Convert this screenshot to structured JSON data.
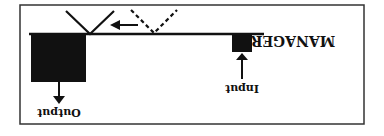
{
  "diagram": {
    "orientation": "rotated 180 degrees",
    "title": "MANAGER",
    "input_label": "Input",
    "output_label": "Output",
    "colors": {
      "ink": "#111111",
      "frame": "#333333",
      "background": "#ffffff"
    }
  }
}
